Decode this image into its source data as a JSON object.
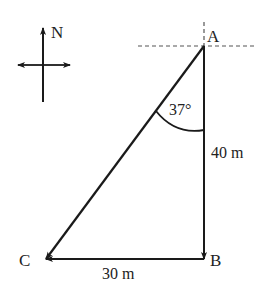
{
  "diagram": {
    "type": "vector-triangle",
    "points": {
      "A": {
        "label": "A",
        "x": 204,
        "y": 46
      },
      "B": {
        "label": "B",
        "x": 204,
        "y": 259
      },
      "C": {
        "label": "C",
        "x": 46,
        "y": 259
      }
    },
    "compass": {
      "label": "N"
    },
    "angle": {
      "label": "37°",
      "at": "A",
      "between": [
        "AB",
        "AC"
      ]
    },
    "sides": {
      "AB": {
        "label": "40 m"
      },
      "BC": {
        "label": "30 m"
      }
    },
    "colors": {
      "line": "#1a1a1a",
      "dashed": "#555555",
      "text": "#222222"
    }
  }
}
